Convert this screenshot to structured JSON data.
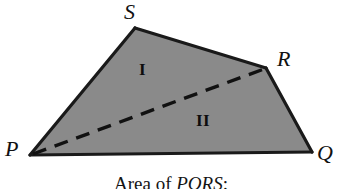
{
  "figure": {
    "type": "geometry-diagram",
    "shape": "quadrilateral",
    "background_color": "#ffffff",
    "fill_color": "#8a8a8a",
    "stroke_color": "#1a1a1a",
    "dashed_stroke_color": "#111111",
    "vertices": [
      {
        "name": "P",
        "label": "P",
        "x": 30,
        "y": 155
      },
      {
        "name": "Q",
        "label": "Q",
        "x": 312,
        "y": 152
      },
      {
        "name": "R",
        "label": "R",
        "x": 266,
        "y": 68
      },
      {
        "name": "S",
        "label": "S",
        "x": 135,
        "y": 28
      }
    ],
    "edges": [
      {
        "name": "edge-PS",
        "from": "P",
        "to": "S",
        "style": "solid"
      },
      {
        "name": "edge-SR",
        "from": "S",
        "to": "R",
        "style": "solid"
      },
      {
        "name": "edge-RQ",
        "from": "R",
        "to": "Q",
        "style": "solid"
      },
      {
        "name": "edge-QP",
        "from": "Q",
        "to": "P",
        "style": "solid"
      }
    ],
    "diagonal": {
      "name": "diagonal-PR",
      "from": "P",
      "to": "R",
      "style": "dashed",
      "dash_pattern": "14 9"
    },
    "regions": [
      {
        "name": "region-upper",
        "label": "I",
        "triangle": "PSR"
      },
      {
        "name": "region-lower",
        "label": "II",
        "triangle": "PRQ"
      }
    ]
  },
  "caption": {
    "prefix": "Area of ",
    "figure_name": "PQRS",
    "suffix": ":",
    "full_text": "Area of PQRS:"
  }
}
